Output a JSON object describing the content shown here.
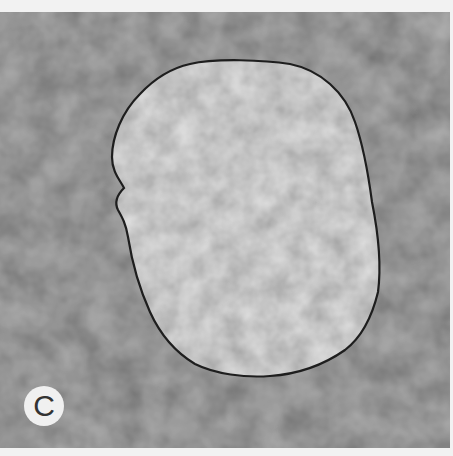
{
  "figure": {
    "panel_label": "C",
    "colors": {
      "background_field": "#4a4a4a",
      "nucleus_fill": "#8a8a8a",
      "nucleus_outline": "#1e1e1e",
      "label_circle": "#f0f0f0",
      "label_text": "#333333",
      "border": "#f2f2f2"
    }
  }
}
